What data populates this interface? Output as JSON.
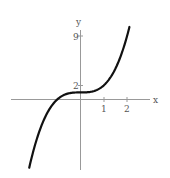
{
  "chart_data": {
    "type": "line",
    "title": "",
    "xlabel": "x",
    "ylabel": "y",
    "x_ticks": [
      "1",
      "2"
    ],
    "y_ticks": [
      "2",
      "9"
    ],
    "series": [
      {
        "name": "f(x) = x^3 + 1",
        "x": [
          -2.2,
          -2.0,
          -1.5,
          -1.0,
          -0.5,
          0.0,
          0.5,
          1.0,
          1.5,
          2.0,
          2.1
        ],
        "values": [
          -9.65,
          -7.0,
          -2.375,
          0.0,
          0.875,
          1.0,
          1.125,
          2.0,
          4.375,
          9.0,
          10.26
        ]
      }
    ],
    "xlim": [
      -3.4,
      2.8
    ],
    "ylim": [
      -10.5,
      10.5
    ],
    "grid": false,
    "legend": "none"
  },
  "labels": {
    "x_axis": "x",
    "y_axis": "y",
    "tick_x1": "1",
    "tick_x2": "2",
    "tick_y2": "2",
    "tick_y9": "9"
  }
}
